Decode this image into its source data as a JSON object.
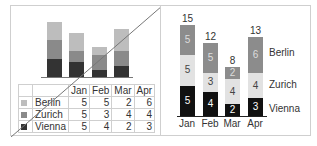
{
  "chart_data": [
    {
      "type": "bar",
      "stacked": true,
      "title": "",
      "categories": [
        "Jan",
        "Feb",
        "Mar",
        "Apr"
      ],
      "series": [
        {
          "name": "Vienna",
          "values": [
            5,
            4,
            2,
            3
          ],
          "color": "#333333"
        },
        {
          "name": "Zurich",
          "values": [
            5,
            3,
            4,
            4
          ],
          "color": "#8a8a8a"
        },
        {
          "name": "Berlin",
          "values": [
            5,
            5,
            2,
            6
          ],
          "color": "#bdbdbd"
        }
      ],
      "data_table": true,
      "legend_position": "data-table",
      "crossed_out": true
    },
    {
      "type": "bar",
      "stacked": true,
      "title": "",
      "categories": [
        "Jan",
        "Feb",
        "Mar",
        "Apr"
      ],
      "series": [
        {
          "name": "Vienna",
          "values": [
            5,
            4,
            2,
            3
          ],
          "color": "#111111"
        },
        {
          "name": "Zurich",
          "values": [
            5,
            3,
            4,
            4
          ],
          "color": "#e2e2e2"
        },
        {
          "name": "Berlin",
          "values": [
            5,
            5,
            2,
            6
          ],
          "color": "#8c8c8c"
        }
      ],
      "totals": [
        15,
        12,
        8,
        13
      ],
      "data_labels": true,
      "legend_position": "right-inline"
    }
  ],
  "left": {
    "table": {
      "headers": [
        "",
        "Jan",
        "Feb",
        "Mar",
        "Apr"
      ],
      "rows": [
        {
          "label": "Berlin",
          "values": [
            "5",
            "5",
            "2",
            "6"
          ],
          "color": "#bdbdbd"
        },
        {
          "label": "Zurich",
          "values": [
            "5",
            "3",
            "4",
            "4"
          ],
          "color": "#8a8a8a"
        },
        {
          "label": "Vienna",
          "values": [
            "5",
            "4",
            "2",
            "3"
          ],
          "color": "#333333"
        }
      ]
    }
  },
  "right": {
    "categories": [
      "Jan",
      "Feb",
      "Mar",
      "Apr"
    ],
    "totals": [
      "15",
      "12",
      "8",
      "13"
    ],
    "legend": [
      "Berlin",
      "Zurich",
      "Vienna"
    ]
  }
}
